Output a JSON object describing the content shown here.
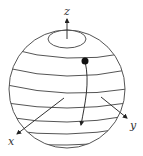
{
  "figure": {
    "colors": {
      "stroke": "#555555",
      "axis": "#333333",
      "point": "#111111",
      "background": "#ffffff"
    },
    "sphere": {
      "cx": 67,
      "cy": 89,
      "rx": 58,
      "ry": 59
    },
    "polar_cap": {
      "cx": 67,
      "cy": 39,
      "rx": 19,
      "ry": 9
    },
    "latitude_lines": [
      {
        "y_left": 48,
        "y_mid": 58,
        "y_right": 53
      },
      {
        "y_left": 68,
        "y_mid": 76,
        "y_right": 70
      },
      {
        "y_left": 85,
        "y_mid": 93,
        "y_right": 89
      },
      {
        "y_left": 103,
        "y_mid": 108,
        "y_right": 103
      },
      {
        "y_left": 117,
        "y_mid": 122,
        "y_right": 116
      },
      {
        "y_left": 130,
        "y_mid": 134,
        "y_right": 128
      },
      {
        "y_left": 143,
        "y_mid": 145,
        "y_right": 141
      }
    ],
    "axes": {
      "z": {
        "label": "z",
        "from": [
          67,
          39
        ],
        "to": [
          67,
          19
        ],
        "label_pos": [
          64,
          15
        ]
      },
      "x": {
        "label": "x",
        "from": [
          64,
          98
        ],
        "to": [
          17,
          134
        ],
        "label_pos": [
          8,
          145
        ]
      },
      "y": {
        "label": "y",
        "from": [
          101,
          97
        ],
        "to": [
          127,
          118
        ],
        "label_pos": [
          130,
          129
        ]
      }
    },
    "trajectory": {
      "start_point": [
        85,
        61
      ],
      "end_point": [
        81,
        125
      ],
      "point_radius": 3.5
    }
  }
}
